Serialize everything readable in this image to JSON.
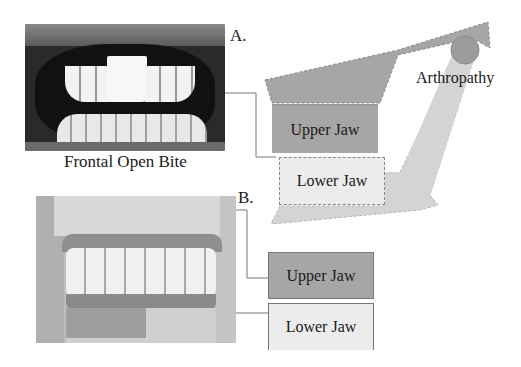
{
  "panel_a": {
    "letter": "A.",
    "photo_caption": "Frontal Open Bite",
    "photo_description": "frontal intraoral photograph of teeth showing open bite",
    "schematic": {
      "upper_jaw_label": "Upper Jaw",
      "lower_jaw_label": "Lower Jaw",
      "joint_label": "Arthropathy"
    }
  },
  "panel_b": {
    "letter": "B.",
    "photo_description": "lateral view of dental cast model",
    "upper_jaw_label": "Upper Jaw",
    "lower_jaw_label": "Lower Jaw"
  },
  "colors": {
    "upper_jaw_fill": "#a6a6a6",
    "lower_jaw_fill": "#ececec",
    "mandible_fill": "#d4d4d4",
    "condyle_fill": "#9c9c9c",
    "leader_line": "#666666"
  }
}
